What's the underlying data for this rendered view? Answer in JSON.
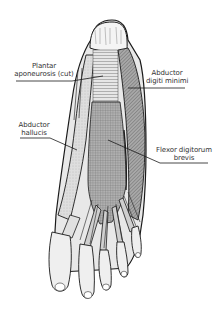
{
  "figure": {
    "colors": {
      "background": "#ffffff",
      "outline": "#1a1a1a",
      "light_muscle": "#d9d9d9",
      "mid_muscle": "#9a9a9a",
      "dark_muscle": "#555555",
      "heel": "#f2f2f2"
    }
  },
  "labels": [
    {
      "id": "plantar-aponeurosis",
      "line1": "Plantar",
      "line2": "aponeurosis (cut)"
    },
    {
      "id": "abductor-digiti-minimi",
      "line1": "Abductor",
      "line2": "digiti minimi"
    },
    {
      "id": "abductor-hallucis",
      "line1": "Abductor",
      "line2": "hallucis"
    },
    {
      "id": "flexor-digitorum-brevis",
      "line1": "Flexor digitorum",
      "line2": "brevis"
    }
  ]
}
